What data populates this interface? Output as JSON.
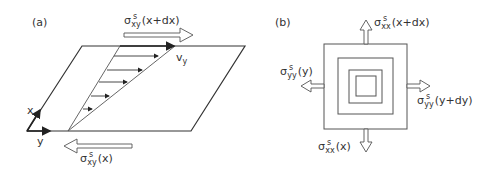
{
  "panels": {
    "a": {
      "label": "(a)",
      "axis_x": "x",
      "axis_y": "y",
      "velocity": {
        "base": "v",
        "sub": "y"
      },
      "stress_top": {
        "sym": "σ",
        "sup": "s",
        "sub": "xy",
        "arg": "(x+dx)"
      },
      "stress_bottom": {
        "sym": "σ",
        "sup": "s",
        "sub": "xy",
        "arg": "(x)"
      }
    },
    "b": {
      "label": "(b)",
      "stress_top": {
        "sym": "σ",
        "sup": "s",
        "sub": "xx",
        "arg": "(x+dx)"
      },
      "stress_left": {
        "sym": "σ",
        "sup": "s",
        "sub": "yy",
        "arg": "(y)"
      },
      "stress_right": {
        "sym": "σ",
        "sup": "s",
        "sub": "yy",
        "arg": "(y+dy)"
      },
      "stress_bottom": {
        "sym": "σ",
        "sup": "s",
        "sub": "xx",
        "arg": "(x)"
      }
    }
  },
  "colors": {
    "line": "#333333",
    "text": "#333333",
    "background": "#ffffff"
  }
}
